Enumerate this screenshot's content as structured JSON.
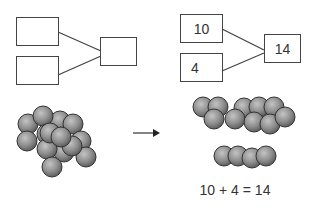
{
  "left_diagram": {
    "part_top": "",
    "part_bottom": "",
    "whole": ""
  },
  "right_diagram": {
    "part_top": "10",
    "part_bottom": "4",
    "whole": "14"
  },
  "equation": "10 + 4 = 14",
  "colors": {
    "line": "#444444",
    "ball": "#8a8a8a",
    "ball_outline": "#333333"
  },
  "counters": {
    "unsorted_total": 14,
    "group_of_ten": 10,
    "group_of_four": 4
  }
}
